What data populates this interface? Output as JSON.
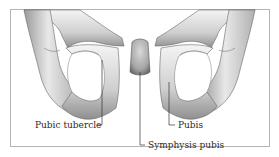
{
  "figure": {
    "labels": {
      "pubic_tubercle": "Pubic tubercle",
      "pubis": "Pubis",
      "symphysis_pubis": "Symphysis pubis"
    },
    "colors": {
      "frame": "#b5b5b5",
      "bone_light": "#f2f2f2",
      "bone_mid": "#c8c8c8",
      "bone_dark": "#8a8a8a",
      "outline": "#555555",
      "leader_line": "#333333",
      "text": "#2a2a2a"
    }
  }
}
